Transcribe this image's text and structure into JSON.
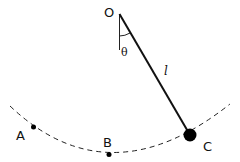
{
  "diagram": {
    "labels": {
      "pivot": "O",
      "angle": "θ",
      "length": "l",
      "point_a": "A",
      "point_b": "B",
      "point_c": "C"
    },
    "colors": {
      "line": "#111111",
      "background": "#ffffff"
    }
  }
}
